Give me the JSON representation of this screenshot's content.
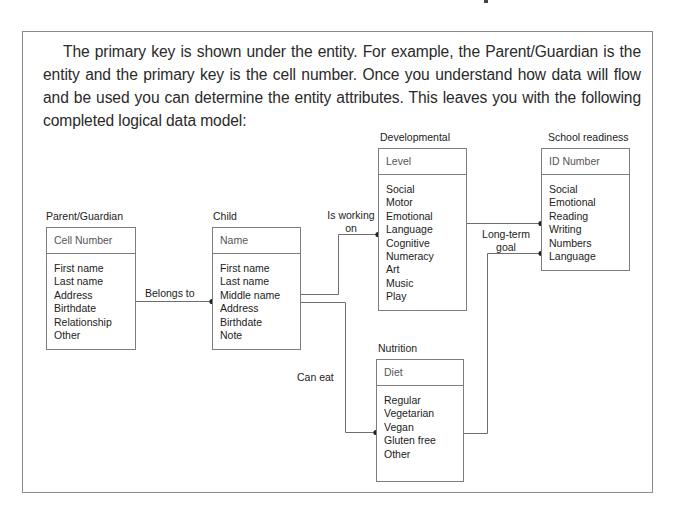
{
  "paragraph": "The primary key is shown under the entity. For example, the Parent/Guardian is the entity and the primary key is the cell number. Once you understand how data will flow and be used you can determine the entity attributes. This leaves you with the following completed logical data model:",
  "diagram": {
    "entities": [
      {
        "id": "parent",
        "title": "Parent/Guardian",
        "key": "Cell Number",
        "attributes": [
          "First name",
          "Last name",
          "Address",
          "Birthdate",
          "Relationship",
          "Other"
        ]
      },
      {
        "id": "child",
        "title": "Child",
        "key": "Name",
        "attributes": [
          "First name",
          "Last name",
          "Middle name",
          "Address",
          "Birthdate",
          "Note"
        ]
      },
      {
        "id": "developmental",
        "title": "Developmental",
        "key": "Level",
        "attributes": [
          "Social",
          "Motor",
          "Emotional",
          "Language",
          "Cognitive",
          "Numeracy",
          "Art",
          "Music",
          "Play"
        ]
      },
      {
        "id": "school",
        "title": "School readiness",
        "key": "ID Number",
        "attributes": [
          "Social",
          "Emotional",
          "Reading",
          "Writing",
          "Numbers",
          "Language"
        ]
      },
      {
        "id": "nutrition",
        "title": "Nutrition",
        "key": "Diet",
        "attributes": [
          "Regular",
          "Vegetarian",
          "Vegan",
          "Gluten free",
          "Other"
        ]
      }
    ],
    "relationships": [
      {
        "from": "parent",
        "to": "child",
        "label": "Belongs to"
      },
      {
        "from": "child",
        "to": "developmental",
        "label_line1": "Is working",
        "label_line2": "on"
      },
      {
        "from": "child",
        "to": "nutrition",
        "label": "Can eat"
      },
      {
        "from": "developmental",
        "to": "school",
        "label_line1": "Long-term",
        "label_line2": "goal"
      },
      {
        "from": "nutrition",
        "to": "school",
        "label": "Long-term goal (shared)"
      }
    ],
    "line_color": "#6e6e6e",
    "border_color": "#7d7d7d"
  }
}
